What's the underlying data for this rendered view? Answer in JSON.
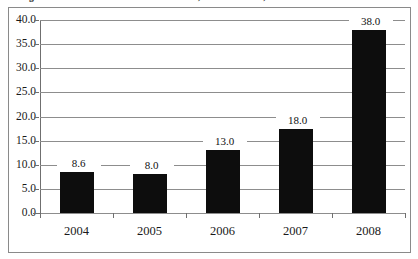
{
  "figure": {
    "title_clipped": "Uganda: Care Seven Production in Tonnes, in Metric Tons, 2004-2008",
    "title_is_clipped": true
  },
  "chart_data": {
    "type": "bar",
    "title": "Uganda: Care Seven Production in Tonnes, in Metric Tons, 2004-2008",
    "categories": [
      "2004",
      "2005",
      "2006",
      "2007",
      "2008"
    ],
    "values": [
      8.6,
      8.0,
      13.0,
      18.0,
      38.0
    ],
    "bar_rendered_values": [
      8.6,
      8.0,
      13.0,
      17.5,
      38.0
    ],
    "data_labels": [
      "8.6",
      "8.0",
      "13.0",
      "18.0",
      "38.0"
    ],
    "xlabel": "",
    "ylabel": "",
    "ylim": [
      0.0,
      40.0
    ],
    "ytick_step": 5.0,
    "ytick_labels": [
      "0.0",
      "5.0",
      "10.0",
      "15.0",
      "20.0",
      "25.0",
      "30.0",
      "35.0",
      "40.0"
    ],
    "ytick_values": [
      0.0,
      5.0,
      10.0,
      15.0,
      20.0,
      25.0,
      30.0,
      35.0,
      40.0
    ],
    "grid": true,
    "grid_axis": "y",
    "legend": false,
    "legend_position": "none",
    "bar_color": "#0d0d0d",
    "grid_color": "#8d8d8d",
    "axis_color": "#6f6f6f",
    "background_color": "#ffffff",
    "frame_border_color": "#8a8a8a"
  }
}
